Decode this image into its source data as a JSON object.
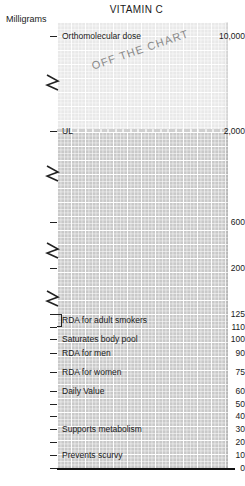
{
  "chart_data": {
    "type": "bar",
    "title": "VITAMIN C",
    "ylabel": "Milligrams",
    "xlabel": "",
    "grid": true,
    "legend": "none",
    "ylim": [
      0,
      10000
    ],
    "annotations": [
      {
        "text": "OFF THE CHART",
        "rotation": -19
      }
    ],
    "axis_breaks": 4,
    "threshold_line": {
      "value": 2000,
      "label": "UL"
    },
    "categories": [
      "Prevents scurvy",
      "Supports metabolism",
      "Daily Value",
      "RDA for women",
      "RDA for men",
      "Saturates body pool",
      "RDA for adult smokers",
      "UL",
      "Orthomolecular dose"
    ],
    "values": [
      10,
      30,
      60,
      75,
      90,
      100,
      125,
      2000,
      10000
    ],
    "ticks": [
      {
        "value": "0",
        "label": "",
        "y": 468
      },
      {
        "value": "10",
        "label": "Prevents scurvy",
        "y": 455
      },
      {
        "value": "20",
        "label": "",
        "y": 442
      },
      {
        "value": "30",
        "label": "Supports metabolism",
        "y": 429
      },
      {
        "value": "40",
        "label": "",
        "y": 416
      },
      {
        "value": "50",
        "label": "",
        "y": 404
      },
      {
        "value": "60",
        "label": "Daily Value",
        "y": 391
      },
      {
        "value": "75",
        "label": "RDA for women",
        "y": 372
      },
      {
        "value": "90",
        "label": "RDA for men",
        "y": 353
      },
      {
        "value": "100",
        "label": "Saturates body pool",
        "y": 339
      },
      {
        "value": "110",
        "label": "",
        "y": 327
      },
      {
        "value": "125",
        "label": "",
        "y": 314
      },
      {
        "value": "200",
        "label": "",
        "y": 268
      },
      {
        "value": "600",
        "label": "",
        "y": 222
      },
      {
        "value": "2,000",
        "label": "UL",
        "y": 131
      },
      {
        "value": "10,000",
        "label": "Orthomolecular dose",
        "y": 36
      }
    ],
    "bracket_label": "RDA for adult smokers",
    "colors": {
      "band_above": "#e9e9e9",
      "band_below": "#c9c9c9",
      "grid": "#ffffff",
      "text": "#1a1a1a",
      "annotation": "#8a8a8a",
      "baseline": "#111111"
    }
  }
}
